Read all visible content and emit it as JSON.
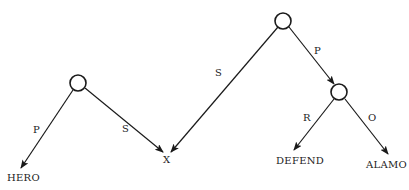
{
  "diagram": {
    "title": "",
    "colors": {
      "stroke": "#1a1a1a",
      "text": "#222222",
      "background": "#ffffff"
    },
    "nodes": [
      {
        "id": "n1",
        "type": "circle",
        "cx": 78,
        "cy": 83,
        "r": 8
      },
      {
        "id": "n2",
        "type": "circle",
        "cx": 283,
        "cy": 21,
        "r": 8
      },
      {
        "id": "n3",
        "type": "circle",
        "cx": 339,
        "cy": 92,
        "r": 8
      }
    ],
    "leaves": [
      {
        "id": "hero",
        "label": "HERO",
        "x": 7,
        "y": 181
      },
      {
        "id": "x",
        "label": "X",
        "x": 163,
        "y": 163
      },
      {
        "id": "defend",
        "label": "DEFEND",
        "x": 276,
        "y": 164
      },
      {
        "id": "alamo",
        "label": "ALAMO",
        "x": 366,
        "y": 168
      }
    ],
    "edges": [
      {
        "from": "n1",
        "to": "hero",
        "label": "P",
        "x1": 73,
        "y1": 90,
        "x2": 21,
        "y2": 168,
        "lx": 33,
        "ly": 133
      },
      {
        "from": "n1",
        "to": "x",
        "label": "S",
        "x1": 85,
        "y1": 88,
        "x2": 163,
        "y2": 152,
        "lx": 122,
        "ly": 132
      },
      {
        "from": "n2",
        "to": "x",
        "label": "S",
        "x1": 278,
        "y1": 27,
        "x2": 171,
        "y2": 152,
        "lx": 215,
        "ly": 76
      },
      {
        "from": "n2",
        "to": "n3",
        "label": "P",
        "x1": 289,
        "y1": 27,
        "x2": 334,
        "y2": 84,
        "lx": 314,
        "ly": 54
      },
      {
        "from": "n3",
        "to": "defend",
        "label": "R",
        "x1": 334,
        "y1": 99,
        "x2": 294,
        "y2": 150,
        "lx": 303,
        "ly": 121
      },
      {
        "from": "n3",
        "to": "alamo",
        "label": "O",
        "x1": 345,
        "y1": 99,
        "x2": 388,
        "y2": 154,
        "lx": 368,
        "ly": 121
      }
    ]
  }
}
